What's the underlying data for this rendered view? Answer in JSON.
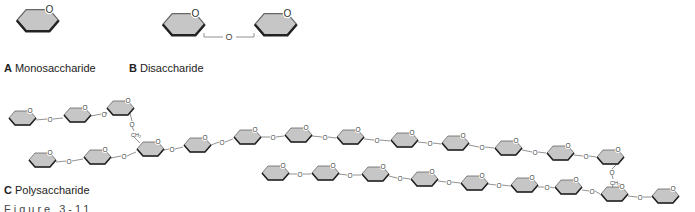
{
  "labels": {
    "a_letter": "A",
    "a_text": "Monosaccharide",
    "b_letter": "B",
    "b_text": "Disaccharide",
    "c_letter": "C",
    "c_text": "Polysaccharide",
    "figure": "Figure 3-11"
  },
  "glyphs": {
    "oxygen": "O",
    "ch2": "CH₂"
  },
  "colors": {
    "ring_fill": "#c6c6c6",
    "ring_stroke": "#555555",
    "ring_bottom": "#222222",
    "bond": "#777777"
  },
  "structures": {
    "monosaccharide": {
      "rings": [
        [
          37,
          22,
          1.55
        ]
      ]
    },
    "disaccharide": {
      "rings": [
        [
          183,
          26,
          1.55
        ],
        [
          275,
          26,
          1.55
        ]
      ],
      "bonds": [
        [
          [
            210,
            36
          ],
          [
            222,
            36
          ],
          [
            236,
            36
          ],
          [
            250,
            36
          ]
        ]
      ],
      "linkO": [
        [
          229,
          37
        ]
      ]
    },
    "polysaccharide": {
      "rings": [
        [
          22,
          119,
          1
        ],
        [
          77,
          116,
          1
        ],
        [
          120,
          109,
          1
        ],
        [
          42,
          161,
          1
        ],
        [
          97,
          158,
          1
        ],
        [
          150,
          150,
          1
        ],
        [
          197,
          146,
          1
        ],
        [
          247,
          138,
          1
        ],
        [
          298,
          136,
          1
        ],
        [
          350,
          138,
          1
        ],
        [
          404,
          141,
          1
        ],
        [
          455,
          144,
          1
        ],
        [
          508,
          149,
          1
        ],
        [
          560,
          154,
          1
        ],
        [
          610,
          158,
          1
        ],
        [
          275,
          174,
          1
        ],
        [
          325,
          174,
          1
        ],
        [
          375,
          175,
          1
        ],
        [
          424,
          180,
          1
        ],
        [
          474,
          184,
          1
        ],
        [
          524,
          186,
          1
        ],
        [
          568,
          188,
          1
        ],
        [
          614,
          195,
          1
        ],
        [
          665,
          197,
          1
        ]
      ],
      "links": [
        [
          36,
          120,
          50,
          119,
          63,
          118
        ],
        [
          91,
          116,
          104,
          114,
          106,
          112
        ],
        [
          56,
          162,
          69,
          161,
          83,
          159
        ],
        [
          111,
          158,
          124,
          156,
          136,
          152
        ],
        [
          164,
          150,
          172,
          149,
          183,
          147
        ],
        [
          211,
          145,
          222,
          142,
          233,
          139
        ],
        [
          261,
          137,
          273,
          137,
          284,
          136
        ],
        [
          312,
          136,
          325,
          137,
          336,
          138
        ],
        [
          364,
          139,
          377,
          140,
          390,
          141
        ],
        [
          418,
          142,
          430,
          143,
          441,
          144
        ],
        [
          469,
          145,
          482,
          147,
          494,
          148
        ],
        [
          522,
          150,
          535,
          152,
          546,
          153
        ],
        [
          574,
          155,
          586,
          156,
          596,
          157
        ],
        [
          289,
          174,
          300,
          174,
          311,
          174
        ],
        [
          339,
          174,
          350,
          175,
          361,
          175
        ],
        [
          389,
          176,
          400,
          178,
          410,
          179
        ],
        [
          438,
          181,
          449,
          182,
          460,
          183
        ],
        [
          488,
          184,
          499,
          185,
          510,
          186
        ],
        [
          538,
          187,
          547,
          187,
          554,
          188
        ],
        [
          582,
          190,
          592,
          191,
          600,
          194
        ],
        [
          628,
          196,
          640,
          197,
          651,
          197
        ]
      ],
      "branches": [
        {
          "from": [
            130,
            113
          ],
          "o": [
            132,
            124
          ],
          "ch2": [
            134,
            134
          ],
          "to": [
            140,
            143
          ]
        },
        {
          "from": [
            619,
            162
          ],
          "o": [
            612,
            172
          ],
          "ch2": [
            613,
            182
          ],
          "to": [
            612,
            188
          ]
        }
      ]
    }
  }
}
